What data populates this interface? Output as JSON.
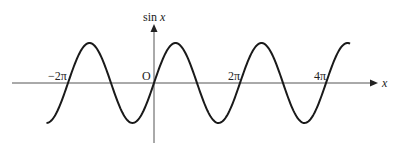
{
  "chart_data": {
    "type": "line",
    "title": "",
    "function": "sin x",
    "xlabel": "x",
    "ylabel": "sin x",
    "origin_label": "O",
    "x_range": [
      -2.5,
      4.56
    ],
    "x_range_unit": "pi",
    "ylim": [
      -1,
      1
    ],
    "grid": false,
    "legend": null,
    "tick_labels": [
      "−2π",
      "2π",
      "4π"
    ],
    "ticks_in_pi": [
      -2,
      2,
      4
    ],
    "series": [
      {
        "name": "sin x",
        "points": [
          {
            "x_pi": -2.5,
            "y": -1
          },
          {
            "x_pi": -2,
            "y": 0
          },
          {
            "x_pi": -1.5,
            "y": 1
          },
          {
            "x_pi": -1,
            "y": 0
          },
          {
            "x_pi": -0.5,
            "y": -1
          },
          {
            "x_pi": 0,
            "y": 0
          },
          {
            "x_pi": 0.5,
            "y": 1
          },
          {
            "x_pi": 1,
            "y": 0
          },
          {
            "x_pi": 1.5,
            "y": -1
          },
          {
            "x_pi": 2,
            "y": 0
          },
          {
            "x_pi": 2.5,
            "y": 1
          },
          {
            "x_pi": 3,
            "y": 0
          },
          {
            "x_pi": 3.5,
            "y": -1
          },
          {
            "x_pi": 4,
            "y": 0
          },
          {
            "x_pi": 4.5,
            "y": 1
          }
        ]
      }
    ],
    "colors": {
      "curve": "#1a1a1a",
      "axes": "#555555"
    }
  },
  "labels": {
    "y_axis": "sin",
    "y_axis_var": "x",
    "x_axis": "x",
    "origin": "O",
    "tick_neg2pi": "−2π",
    "tick_2pi": "2π",
    "tick_4pi": "4π"
  }
}
